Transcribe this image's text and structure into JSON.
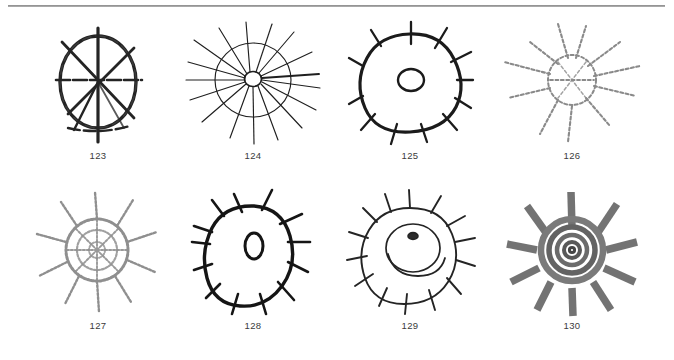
{
  "plate": {
    "background_color": "#ffffff",
    "rule_color": "#8e8e8e",
    "ink_color": "#1c1c1c",
    "faint_ink_color": "#8d8d8d",
    "gray_ink_color": "#6f6f6f",
    "label_color": "#3b3b3b"
  },
  "figures": [
    {
      "label": "123",
      "caption": "123",
      "motif": "circle-with-radiating-spokes",
      "style": "dark-rough-line",
      "ink": "#242424",
      "rays": 7,
      "has_inner_circle": false
    },
    {
      "label": "124",
      "caption": "124",
      "motif": "small-central-circle-with-long-rays-through-outer-circle",
      "style": "thin-line",
      "ink": "#1f1f1f",
      "rays": 17,
      "has_inner_circle": true
    },
    {
      "label": "125",
      "caption": "125",
      "motif": "thick-circle-with-short-radial-ticks-and-inner-circle",
      "style": "thick-line",
      "ink": "#1b1b1b",
      "rays": 12,
      "has_inner_circle": true
    },
    {
      "label": "126",
      "caption": "126",
      "motif": "faint-sun-rays-through-circle",
      "style": "faint-dotted",
      "ink": "#8a8a8a",
      "rays": 9,
      "has_inner_circle": false
    },
    {
      "label": "127",
      "caption": "127",
      "motif": "spoked-wheel-with-rays-beyond-rim",
      "style": "faint-textured",
      "ink": "#8f8f8f",
      "rays": 12,
      "has_inner_circle": true
    },
    {
      "label": "128",
      "caption": "128",
      "motif": "thick-oval-with-inner-oval-and-spikes",
      "style": "thick-line",
      "ink": "#151515",
      "rays": 13,
      "has_inner_circle": true
    },
    {
      "label": "129",
      "caption": "129",
      "motif": "circle-with-spikes-inner-ring-and-dark-centre",
      "style": "thin-line",
      "ink": "#242424",
      "rays": 14,
      "has_inner_circle": true
    },
    {
      "label": "130",
      "caption": "130",
      "motif": "concentric-gray-rings-with-thick-rays",
      "style": "gray-brush",
      "ink": "#6c6c6c",
      "rays": 12,
      "has_inner_circle": true
    }
  ]
}
